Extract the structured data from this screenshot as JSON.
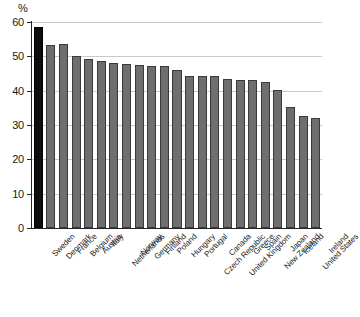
{
  "chart_data": {
    "type": "bar",
    "title": "",
    "subtitle": "",
    "xlabel": "",
    "ylabel": "%",
    "unit_label": "%",
    "ylim": [
      0,
      60
    ],
    "yticks": [
      0,
      10,
      20,
      30,
      40,
      50,
      60
    ],
    "ytick_labels": [
      "0",
      "10",
      "20",
      "30",
      "40",
      "50",
      "60"
    ],
    "grid": true,
    "grid_axis": "y",
    "legend": false,
    "legend_position": "none",
    "highlight_category": "Sweden",
    "colors": {
      "bar": "#6e6e6e",
      "bar_edge": "#3a3a3a",
      "highlight_bar": "#0d0d0d",
      "highlight_bar_edge": "#000000",
      "gridline": "#c9c9c9",
      "axis": "#262626",
      "text": "#1a1a1a",
      "background": "#ffffff"
    },
    "categories": [
      "Sweden",
      "Denmark",
      "France",
      "Belgium",
      "Austria",
      "Italy",
      "Netherlands",
      "Norway",
      "Germany",
      "Finland",
      "Poland",
      "Hungary",
      "Portugal",
      "Czech Republic",
      "Canada",
      "United Kingdom",
      "Greece",
      "Spain",
      "New Zealand",
      "Japan",
      "Iceland",
      "United States",
      "Ireland"
    ],
    "values": [
      58.6,
      53.4,
      53.6,
      50.2,
      49.1,
      48.6,
      48.0,
      47.9,
      47.5,
      47.1,
      47.2,
      46.1,
      44.4,
      44.3,
      44.2,
      43.4,
      43.1,
      43.0,
      42.5,
      40.3,
      35.3,
      32.5,
      32.0
    ]
  }
}
